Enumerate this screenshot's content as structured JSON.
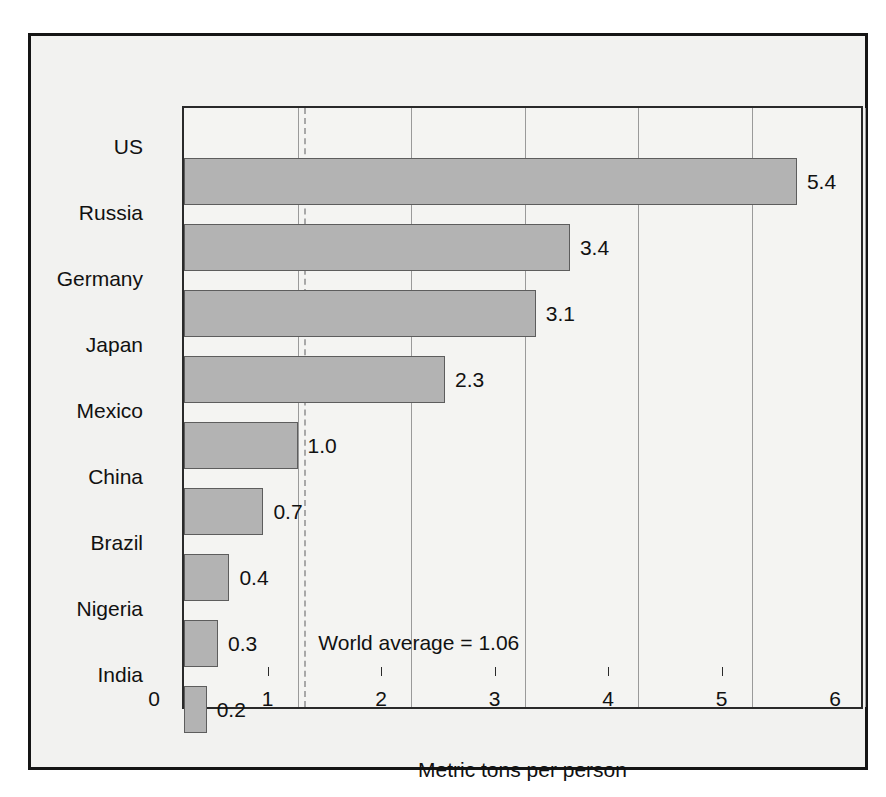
{
  "chart_data": {
    "type": "bar",
    "orientation": "horizontal",
    "title": "",
    "xlabel": "Metric tons per person",
    "ylabel": "",
    "xlim": [
      0,
      6
    ],
    "xticks": [
      "0",
      "1",
      "2",
      "3",
      "4",
      "5",
      "6"
    ],
    "grid": "vertical",
    "legend": "none",
    "categories": [
      "US",
      "Russia",
      "Germany",
      "Japan",
      "Mexico",
      "China",
      "Brazil",
      "Nigeria",
      "India"
    ],
    "values": [
      5.4,
      3.4,
      3.1,
      2.3,
      1.0,
      0.7,
      0.4,
      0.3,
      0.2
    ],
    "value_labels": [
      "5.4",
      "3.4",
      "3.1",
      "2.3",
      "1.0",
      "0.7",
      "0.4",
      "0.3",
      "0.2"
    ],
    "annotations": [
      {
        "text": "World average = 1.06",
        "value": 1.06,
        "kind": "reference-line-dashed"
      }
    ],
    "colors": {
      "bar_fill": "#b3b3b3",
      "bar_stroke": "#5d5d5d",
      "plot_background": "#f4f4f2",
      "figure_background": "#f2f2f0",
      "frame": "#151515",
      "gridline": "#9a9a9a",
      "reference_line": "#a8a8a8",
      "text": "#111111"
    }
  }
}
